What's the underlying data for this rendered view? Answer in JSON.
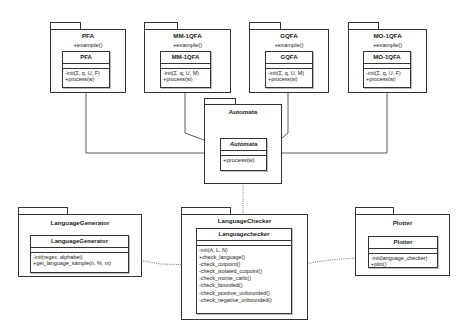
{
  "packages": {
    "pfa": {
      "title": "PFA",
      "operation": "+example()",
      "class": {
        "name": "PFA",
        "operations": [
          "-init(Σ, q, U, F)",
          "+process(w)"
        ]
      }
    },
    "mm1qfa": {
      "title": "MM-1QFA",
      "operation": "+example()",
      "class": {
        "name": "MM-1QFA",
        "operations": [
          "-init(Σ, q, U, M)",
          "+process(w)"
        ]
      }
    },
    "gqfa": {
      "title": "GQFA",
      "operation": "+example()",
      "class": {
        "name": "GQFA",
        "operations": [
          "-init(Σ, q, U, M)",
          "+process(w)"
        ]
      }
    },
    "mo1qfa": {
      "title": "MO-1QFA",
      "operation": "+example()",
      "class": {
        "name": "MO-1QFA",
        "operations": [
          "-init(Σ, q, U, F)",
          "+process(w)"
        ]
      }
    },
    "automata": {
      "title": "Automata",
      "class": {
        "name": "Automata",
        "abstract": true,
        "operations": [
          "+process(w)"
        ]
      }
    },
    "language_generator": {
      "title": "LanguageGenerator",
      "class": {
        "name": "LanguageGenerator",
        "operations": [
          "-init(regex, alphabet)",
          "+get_language_sample(n, %, m)"
        ]
      }
    },
    "language_checker": {
      "title": "LanguageChecker",
      "class": {
        "name": "Languagechecker",
        "operations": [
          "-init(A, L, N)",
          "+check_language()",
          "-check_cutpoint()",
          "-check_isolated_cutpoint()",
          "-check_monte_carlo()",
          "-check_bounded()",
          "-check_positive_unbounded()",
          "-check_negative_unbounded()"
        ]
      }
    },
    "plotter": {
      "title": "Plotter",
      "class": {
        "name": "Plotter",
        "operations": [
          "-init(language_checker)",
          "+plot()"
        ]
      }
    }
  },
  "relationships": [
    {
      "type": "generalization",
      "from": "PFA",
      "to": "Automata"
    },
    {
      "type": "generalization",
      "from": "MM-1QFA",
      "to": "Automata"
    },
    {
      "type": "generalization",
      "from": "GQFA",
      "to": "Automata"
    },
    {
      "type": "generalization",
      "from": "MO-1QFA",
      "to": "Automata"
    },
    {
      "type": "dependency",
      "from": "Automata",
      "to": "LanguageChecker"
    },
    {
      "type": "dependency",
      "from": "LanguageGenerator",
      "to": "LanguageChecker"
    },
    {
      "type": "dependency",
      "from": "LanguageChecker",
      "to": "Plotter"
    }
  ],
  "colors": {
    "line": "#333333",
    "background": "#ffffff",
    "shadow": "#bbbbbb"
  }
}
